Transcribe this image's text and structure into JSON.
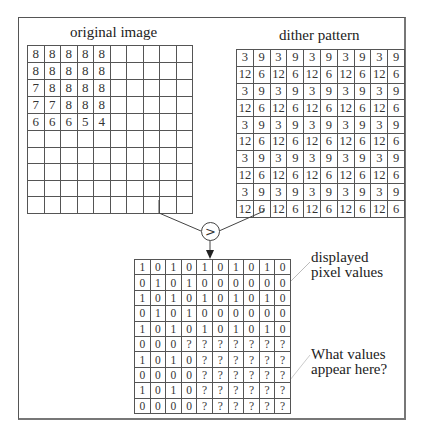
{
  "labels": {
    "original": "original image",
    "dither": "dither pattern",
    "displayed_line1": "displayed",
    "displayed_line2": "pixel values",
    "question_line1": "What values",
    "question_line2": "appear here?"
  },
  "comparator": {
    "symbol": ">",
    "icon": "greater-than-comparator-icon"
  },
  "original_image": {
    "rows": [
      [
        "8",
        "8",
        "8",
        "8",
        "8",
        "",
        "",
        "",
        "",
        ""
      ],
      [
        "8",
        "8",
        "8",
        "8",
        "8",
        "",
        "",
        "",
        "",
        ""
      ],
      [
        "7",
        "8",
        "8",
        "8",
        "8",
        "",
        "",
        "",
        "",
        ""
      ],
      [
        "7",
        "7",
        "8",
        "8",
        "8",
        "",
        "",
        "",
        "",
        ""
      ],
      [
        "6",
        "6",
        "6",
        "5",
        "4",
        "",
        "",
        "",
        "",
        ""
      ],
      [
        "",
        "",
        "",
        "",
        "",
        "",
        "",
        "",
        "",
        ""
      ],
      [
        "",
        "",
        "",
        "",
        "",
        "",
        "",
        "",
        "",
        ""
      ],
      [
        "",
        "",
        "",
        "",
        "",
        "",
        "",
        "",
        "",
        ""
      ],
      [
        "",
        "",
        "",
        "",
        "",
        "",
        "",
        "",
        "",
        ""
      ],
      [
        "",
        "",
        "",
        "",
        "",
        "",
        "",
        "",
        "",
        ""
      ]
    ]
  },
  "dither_pattern": {
    "rows": [
      [
        "3",
        "9",
        "3",
        "9",
        "3",
        "9",
        "3",
        "9",
        "3",
        "9"
      ],
      [
        "12",
        "6",
        "12",
        "6",
        "12",
        "6",
        "12",
        "6",
        "12",
        "6"
      ],
      [
        "3",
        "9",
        "3",
        "9",
        "3",
        "9",
        "3",
        "9",
        "3",
        "9"
      ],
      [
        "12",
        "6",
        "12",
        "6",
        "12",
        "6",
        "12",
        "6",
        "12",
        "6"
      ],
      [
        "3",
        "9",
        "3",
        "9",
        "3",
        "9",
        "3",
        "9",
        "3",
        "9"
      ],
      [
        "12",
        "6",
        "12",
        "6",
        "12",
        "6",
        "12",
        "6",
        "12",
        "6"
      ],
      [
        "3",
        "9",
        "3",
        "9",
        "3",
        "9",
        "3",
        "9",
        "3",
        "9"
      ],
      [
        "12",
        "6",
        "12",
        "6",
        "12",
        "6",
        "12",
        "6",
        "12",
        "6"
      ],
      [
        "3",
        "9",
        "3",
        "9",
        "3",
        "9",
        "3",
        "9",
        "3",
        "9"
      ],
      [
        "12",
        "6",
        "12",
        "6",
        "12",
        "6",
        "12",
        "6",
        "12",
        "6"
      ]
    ]
  },
  "displayed_pixels": {
    "rows": [
      [
        "1",
        "0",
        "1",
        "0",
        "1",
        "0",
        "1",
        "0",
        "1",
        "0"
      ],
      [
        "0",
        "1",
        "0",
        "1",
        "0",
        "0",
        "0",
        "0",
        "0",
        "0"
      ],
      [
        "1",
        "0",
        "1",
        "0",
        "1",
        "0",
        "1",
        "0",
        "1",
        "0"
      ],
      [
        "0",
        "1",
        "0",
        "1",
        "0",
        "0",
        "0",
        "0",
        "0",
        "0"
      ],
      [
        "1",
        "0",
        "1",
        "0",
        "1",
        "0",
        "1",
        "0",
        "1",
        "0"
      ],
      [
        "0",
        "0",
        "0",
        "?",
        "?",
        "?",
        "?",
        "?",
        "?",
        "?"
      ],
      [
        "1",
        "0",
        "1",
        "0",
        "?",
        "?",
        "?",
        "?",
        "?",
        "?"
      ],
      [
        "0",
        "0",
        "0",
        "0",
        "?",
        "?",
        "?",
        "?",
        "?",
        "?"
      ],
      [
        "1",
        "0",
        "1",
        "0",
        "?",
        "?",
        "?",
        "?",
        "?",
        "?"
      ],
      [
        "0",
        "0",
        "0",
        "0",
        "?",
        "?",
        "?",
        "?",
        "?",
        "?"
      ]
    ]
  }
}
